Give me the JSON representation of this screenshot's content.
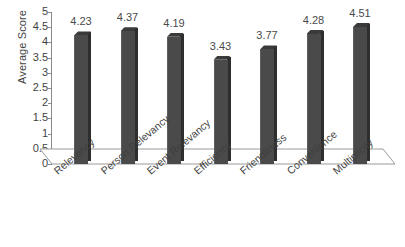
{
  "chart_data": {
    "type": "bar",
    "title": "",
    "xlabel": "",
    "ylabel": "Average Score",
    "categories": [
      "Relevancy",
      "Person Relevancy",
      "Event Relevancy",
      "Efficiency",
      "Friendliness",
      "Convenience",
      "Multiplicity"
    ],
    "values": [
      4.23,
      4.37,
      4.19,
      3.43,
      3.77,
      4.28,
      4.51
    ],
    "value_labels": [
      "4.23",
      "4.37",
      "4.19",
      "3.43",
      "3.77",
      "4.28",
      "4.51"
    ],
    "ylim": [
      0,
      5
    ],
    "ytick_values": [
      0,
      0.5,
      1,
      1.5,
      2,
      2.5,
      3,
      3.5,
      4,
      4.5,
      5
    ],
    "ytick_labels": [
      "0",
      "0.5",
      "1",
      "1.5",
      "2",
      "2.5",
      "3",
      "3.5",
      "4",
      "4.5",
      "5"
    ],
    "grid": false,
    "legend": null,
    "legend_position": "none",
    "series": [
      {
        "name": "Average Score",
        "values": [
          4.23,
          4.37,
          4.19,
          3.43,
          3.77,
          4.28,
          4.51
        ]
      }
    ],
    "style": {
      "bar_color": "#4a4a4a",
      "bar_side_color": "#2e2e2e",
      "bar_top_color": "#3a3a3a",
      "axis_color": "#8a8a8a",
      "text_color": "#3f3f3f",
      "background": "#ffffff",
      "three_d": true,
      "xtick_rotation": -40
    }
  }
}
